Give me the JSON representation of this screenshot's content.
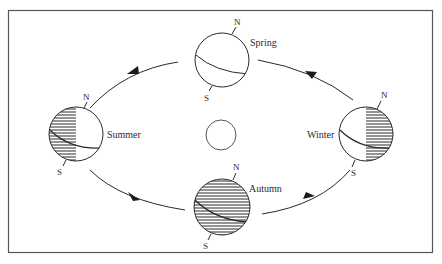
{
  "diagram": {
    "type": "earth-orbit-seasons",
    "colors": {
      "ink": "#2a2a2a",
      "frame": "#555555",
      "background": "#ffffff"
    },
    "sun": {
      "cx": 221,
      "cy": 135,
      "r": 15
    },
    "globes": [
      {
        "id": "spring",
        "label": "Spring",
        "cx": 222,
        "cy": 60,
        "r": 27,
        "north": "N",
        "south": "S",
        "shading": "none"
      },
      {
        "id": "summer",
        "label": "Summer",
        "cx": 76,
        "cy": 134,
        "r": 27,
        "north": "N",
        "south": "S",
        "shading": "left-half"
      },
      {
        "id": "autumn",
        "label": "Autumn",
        "cx": 222,
        "cy": 207,
        "r": 28,
        "north": "N",
        "south": "S",
        "shading": "full"
      },
      {
        "id": "winter",
        "label": "Winter",
        "cx": 366,
        "cy": 134,
        "r": 27,
        "north": "N",
        "south": "S",
        "shading": "right-half"
      }
    ],
    "labels": {
      "spring": "Spring",
      "summer": "Summer",
      "autumn": "Autumn",
      "winter": "Winter",
      "north": "N",
      "south": "S"
    },
    "orbit_direction": "counter-clockwise (Spring → Summer → Autumn → Winter → Spring)"
  }
}
